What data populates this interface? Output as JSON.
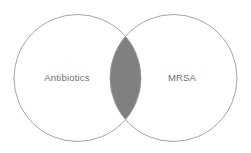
{
  "diagram": {
    "type": "venn",
    "background_color": "#ffffff",
    "stroke_color": "#9a9a9a",
    "stroke_width": 0.9,
    "label_color": "#6e6e6e",
    "intersection_fill": "#808080",
    "sets": [
      {
        "id": "left",
        "label": "Antibiotics",
        "center_x": 77.5,
        "center_y": 78,
        "radius": 63.5,
        "fill": "#ffffff",
        "label_x": 67,
        "label_y": 78
      },
      {
        "id": "right",
        "label": "MRSA",
        "center_x": 173.5,
        "center_y": 78,
        "radius": 63.5,
        "fill": "#ffffff",
        "label_x": 182,
        "label_y": 78
      }
    ],
    "intersection": {
      "id": "overlap",
      "label": "",
      "fill": "#808080",
      "top_crossing_x": 125.5,
      "top_crossing_y": 36.5,
      "bottom_crossing_x": 125.5,
      "bottom_crossing_y": 119.5
    }
  }
}
